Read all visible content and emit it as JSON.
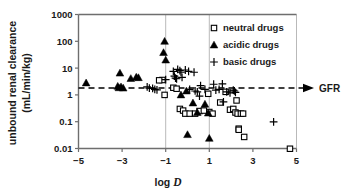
{
  "chart_data": {
    "type": "scatter",
    "title": "",
    "xlabel": "log D",
    "ylabel": "unbound renal clearance (mL/min/kg)",
    "ylabel_line1": "unbound renal clearance",
    "ylabel_line2": "(mL/min/kg)",
    "x_scale": "linear",
    "y_scale": "log",
    "xlim": [
      -5,
      5
    ],
    "ylim": [
      0.01,
      1000
    ],
    "xticks": [
      -5,
      -3,
      -1,
      1,
      3,
      5
    ],
    "xtick_labels": [
      "−5",
      "−3",
      "−1",
      "1",
      "3",
      "5"
    ],
    "yticks": [
      0.01,
      0.1,
      1,
      10,
      100,
      1000
    ],
    "ytick_labels": [
      "0.01",
      "0.1",
      "1",
      "10",
      "100",
      "1000"
    ],
    "grid": "vertical gridlines at log D = -1, 1, 5",
    "gridlines_x": [
      -1,
      1,
      5
    ],
    "legend_position": "top-right inside plot",
    "annotations": [
      {
        "name": "gfr-reference-line",
        "label": "GFR",
        "type": "horizontal dashed line with right arrow",
        "y_value": 1.8
      }
    ],
    "series": [
      {
        "name": "neutral drugs",
        "marker": "open-square",
        "points": [
          [
            -1.05,
            1.0
          ],
          [
            -1.15,
            3.6
          ],
          [
            -1.3,
            3.5
          ],
          [
            -0.65,
            1.85
          ],
          [
            -0.5,
            1.7
          ],
          [
            -0.35,
            0.3
          ],
          [
            -0.2,
            0.26
          ],
          [
            -0.1,
            0.2
          ],
          [
            0.1,
            0.2
          ],
          [
            0.35,
            0.2
          ],
          [
            0.55,
            0.25
          ],
          [
            0.75,
            0.26
          ],
          [
            0.95,
            1.1
          ],
          [
            1.0,
            0.23
          ],
          [
            1.15,
            0.2
          ],
          [
            1.5,
            0.52
          ],
          [
            1.75,
            1.3
          ],
          [
            1.95,
            0.28
          ],
          [
            2.1,
            0.3
          ],
          [
            2.2,
            0.22
          ],
          [
            2.25,
            0.62
          ],
          [
            2.3,
            0.2
          ],
          [
            2.35,
            0.055
          ],
          [
            2.35,
            0.05
          ],
          [
            2.45,
            0.2
          ],
          [
            2.55,
            0.2
          ],
          [
            2.6,
            0.027
          ],
          [
            4.7,
            0.0098
          ]
        ]
      },
      {
        "name": "acidic drugs",
        "marker": "filled-triangle",
        "points": [
          [
            -4.65,
            2.8
          ],
          [
            -3.2,
            2.1
          ],
          [
            -3.15,
            1.85
          ],
          [
            -3.1,
            6.5
          ],
          [
            -3.05,
            2.0
          ],
          [
            -2.95,
            1.8
          ],
          [
            -2.6,
            4.1
          ],
          [
            -2.35,
            4.6
          ],
          [
            -2.25,
            4.4
          ],
          [
            -1.05,
            100
          ],
          [
            -1.1,
            38
          ],
          [
            -1.0,
            20
          ],
          [
            -0.3,
            1.0
          ],
          [
            -0.05,
            1.4
          ],
          [
            0.25,
            0.5
          ],
          [
            0.45,
            0.22
          ],
          [
            0.8,
            0.45
          ],
          [
            0.95,
            0.21
          ],
          [
            0.0,
            0.033
          ],
          [
            1.0,
            0.024
          ]
        ]
      },
      {
        "name": "basic drugs",
        "marker": "plus",
        "points": [
          [
            -1.85,
            2.0
          ],
          [
            -1.75,
            1.8
          ],
          [
            -1.6,
            1.75
          ],
          [
            -1.5,
            1.6
          ],
          [
            -1.4,
            1.55
          ],
          [
            -1.0,
            3.7
          ],
          [
            -0.65,
            7.5
          ],
          [
            -0.6,
            5.0
          ],
          [
            -0.55,
            4.2
          ],
          [
            -0.5,
            4.0
          ],
          [
            -0.45,
            9.0
          ],
          [
            -0.35,
            8.0
          ],
          [
            -0.3,
            7.0
          ],
          [
            -0.25,
            4.5
          ],
          [
            -0.1,
            8.5
          ],
          [
            0.05,
            7.5
          ],
          [
            0.3,
            7.0
          ],
          [
            0.1,
            1.6
          ],
          [
            0.35,
            1.4
          ],
          [
            0.45,
            1.3
          ],
          [
            0.55,
            0.9
          ],
          [
            0.6,
            2.2
          ],
          [
            0.8,
            1.6
          ],
          [
            1.2,
            2.5
          ],
          [
            1.3,
            1.5
          ],
          [
            1.45,
            1.6
          ],
          [
            1.6,
            2.6
          ],
          [
            1.65,
            0.55
          ],
          [
            1.8,
            1.3
          ],
          [
            1.95,
            1.2
          ],
          [
            2.1,
            1.5
          ],
          [
            2.15,
            1.4
          ],
          [
            2.2,
            1.25
          ],
          [
            3.95,
            0.098
          ]
        ]
      }
    ]
  },
  "legend": {
    "items": [
      {
        "label": "neutral drugs",
        "marker": "open-square"
      },
      {
        "label": "acidic drugs",
        "marker": "filled-triangle"
      },
      {
        "label": "basic drugs",
        "marker": "plus"
      }
    ]
  },
  "colors": {
    "axis": "#6e6e6e",
    "grid": "#b9b9b9",
    "marker": "#000000",
    "background": "#ffffff"
  }
}
